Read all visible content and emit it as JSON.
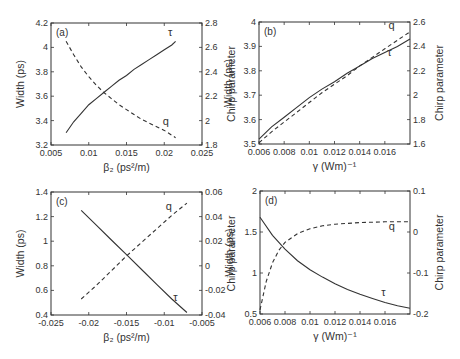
{
  "figure": {
    "colors": {
      "axis": "#333333",
      "solid": "#333333",
      "dashed": "#333333",
      "background": "#ffffff"
    }
  },
  "chart_data": [
    {
      "type": "line",
      "panel": "(a)",
      "xlabel": "β₂ (ps²/m)",
      "ylabel": "Width (ps)",
      "y2label": "Chirp parameter",
      "xlim": [
        0.005,
        0.025
      ],
      "ylim": [
        3.2,
        4.2
      ],
      "y2lim": [
        1.8,
        2.8
      ],
      "xticks": [
        "0.005",
        "0.01",
        "0.015",
        "0.02",
        "0.025"
      ],
      "yticks": [
        "3.2",
        "3.4",
        "3.6",
        "3.8",
        "4",
        "4.2"
      ],
      "y2ticks": [
        "1.8",
        "2",
        "2.2",
        "2.4",
        "2.6",
        "2.8"
      ],
      "grid": false,
      "series": [
        {
          "name": "τ",
          "axis": "left",
          "style": "solid",
          "x": [
            0.007,
            0.008,
            0.009,
            0.01,
            0.011,
            0.012,
            0.013,
            0.014,
            0.015,
            0.016,
            0.017,
            0.018,
            0.019,
            0.02,
            0.021,
            0.0215
          ],
          "y": [
            3.3,
            3.39,
            3.46,
            3.53,
            3.58,
            3.63,
            3.68,
            3.73,
            3.77,
            3.82,
            3.86,
            3.9,
            3.94,
            3.98,
            4.02,
            4.05
          ],
          "label_pos": [
            0.0205,
            4.09
          ]
        },
        {
          "name": "q",
          "axis": "right",
          "style": "dashed",
          "x": [
            0.007,
            0.008,
            0.009,
            0.01,
            0.011,
            0.012,
            0.013,
            0.014,
            0.015,
            0.016,
            0.017,
            0.018,
            0.019,
            0.02,
            0.021,
            0.0215
          ],
          "y": [
            2.65,
            2.54,
            2.44,
            2.36,
            2.29,
            2.23,
            2.18,
            2.13,
            2.09,
            2.05,
            2.01,
            1.98,
            1.95,
            1.92,
            1.88,
            1.86
          ],
          "label_pos": [
            0.0198,
            1.96
          ]
        }
      ]
    },
    {
      "type": "line",
      "panel": "(b)",
      "xlabel": "γ (Wm)⁻¹",
      "ylabel": "Width (ps)",
      "y2label": "Chirp parameter",
      "xlim": [
        0.006,
        0.018
      ],
      "ylim": [
        3.5,
        4.0
      ],
      "y2lim": [
        1.6,
        2.6
      ],
      "xticks": [
        "0.006",
        "0.008",
        "0.01",
        "0.012",
        "0.014",
        "0.016"
      ],
      "yticks": [
        "3.5",
        "3.6",
        "3.7",
        "3.8",
        "3.9",
        "4"
      ],
      "y2ticks": [
        "1.6",
        "1.8",
        "2",
        "2.2",
        "2.4",
        "2.6"
      ],
      "grid": false,
      "series": [
        {
          "name": "τ",
          "axis": "left",
          "style": "solid",
          "x": [
            0.006,
            0.007,
            0.008,
            0.009,
            0.01,
            0.011,
            0.012,
            0.013,
            0.014,
            0.015,
            0.016,
            0.017,
            0.018
          ],
          "y": [
            3.52,
            3.57,
            3.61,
            3.65,
            3.69,
            3.725,
            3.755,
            3.79,
            3.82,
            3.85,
            3.875,
            3.9,
            3.93
          ],
          "label_pos": [
            0.0162,
            3.86
          ]
        },
        {
          "name": "q",
          "axis": "right",
          "style": "dashed",
          "x": [
            0.006,
            0.007,
            0.008,
            0.009,
            0.01,
            0.011,
            0.012,
            0.013,
            0.014,
            0.015,
            0.016,
            0.017,
            0.018
          ],
          "y": [
            1.61,
            1.7,
            1.78,
            1.86,
            1.94,
            2.02,
            2.09,
            2.16,
            2.24,
            2.31,
            2.38,
            2.45,
            2.52
          ],
          "label_pos": [
            0.0163,
            2.54
          ]
        }
      ]
    },
    {
      "type": "line",
      "panel": "(c)",
      "xlabel": "β₂ (ps²/m)",
      "ylabel": "Width (ps)",
      "y2label": "Chirp parameter",
      "xlim": [
        -0.025,
        -0.005
      ],
      "ylim": [
        0.4,
        1.4
      ],
      "y2lim": [
        -0.04,
        0.06
      ],
      "xticks": [
        "-0.025",
        "-0.02",
        "-0.015",
        "-0.01",
        "-0.005"
      ],
      "yticks": [
        "0.4",
        "0.6",
        "0.8",
        "1",
        "1.2",
        "1.4"
      ],
      "y2ticks": [
        "-0.04",
        "-0.02",
        "0",
        "0.02",
        "0.04",
        "0.06"
      ],
      "grid": false,
      "series": [
        {
          "name": "τ",
          "axis": "left",
          "style": "solid",
          "x": [
            -0.021,
            -0.019,
            -0.017,
            -0.015,
            -0.013,
            -0.011,
            -0.009,
            -0.007
          ],
          "y": [
            1.25,
            1.13,
            1.01,
            0.89,
            0.77,
            0.65,
            0.53,
            0.42
          ],
          "label_pos": [
            -0.0088,
            0.51
          ]
        },
        {
          "name": "q",
          "axis": "right",
          "style": "dashed",
          "x": [
            -0.021,
            -0.019,
            -0.017,
            -0.015,
            -0.013,
            -0.011,
            -0.009,
            -0.007
          ],
          "y": [
            -0.027,
            -0.016,
            -0.004,
            0.008,
            0.019,
            0.03,
            0.041,
            0.051
          ],
          "label_pos": [
            -0.0098,
            0.045
          ]
        }
      ]
    },
    {
      "type": "line",
      "panel": "(d)",
      "xlabel": "γ (Wm)⁻¹",
      "ylabel": "Width (ps)",
      "y2label": "Chirp parameter",
      "xlim": [
        0.006,
        0.018
      ],
      "ylim": [
        0.5,
        2.0
      ],
      "y2lim": [
        -0.2,
        0.1
      ],
      "xticks": [
        "0.006",
        "0.008",
        "0.01",
        "0.012",
        "0.014",
        "0.016"
      ],
      "yticks": [
        "0.5",
        "1",
        "1.5",
        "2"
      ],
      "y2ticks": [
        "-0.2",
        "-0.1",
        "0",
        "0.1"
      ],
      "grid": false,
      "series": [
        {
          "name": "τ",
          "axis": "left",
          "style": "solid",
          "x": [
            0.006,
            0.007,
            0.008,
            0.009,
            0.01,
            0.011,
            0.012,
            0.013,
            0.014,
            0.015,
            0.016,
            0.017,
            0.018
          ],
          "y": [
            1.68,
            1.46,
            1.29,
            1.15,
            1.04,
            0.95,
            0.87,
            0.8,
            0.74,
            0.69,
            0.64,
            0.6,
            0.57
          ],
          "label_pos": [
            0.0157,
            0.72
          ]
        },
        {
          "name": "q",
          "axis": "right",
          "style": "dashed",
          "x": [
            0.006,
            0.0065,
            0.007,
            0.0075,
            0.008,
            0.009,
            0.01,
            0.011,
            0.012,
            0.013,
            0.014,
            0.015,
            0.016,
            0.017,
            0.018
          ],
          "y": [
            -0.19,
            -0.12,
            -0.075,
            -0.045,
            -0.025,
            -0.004,
            0.008,
            0.015,
            0.019,
            0.021,
            0.023,
            0.024,
            0.025,
            0.025,
            0.025
          ],
          "label_pos": [
            0.0163,
            0.005
          ]
        }
      ]
    }
  ],
  "layout_boxes": [
    {
      "left": 51,
      "top": 23,
      "right": 202,
      "bottom": 145
    },
    {
      "left": 259,
      "top": 22,
      "right": 410,
      "bottom": 144
    },
    {
      "left": 51,
      "top": 192,
      "right": 202,
      "bottom": 315
    },
    {
      "left": 260,
      "top": 191,
      "right": 410,
      "bottom": 314
    }
  ]
}
